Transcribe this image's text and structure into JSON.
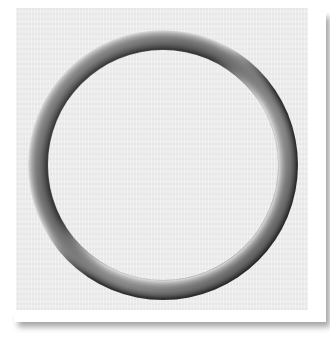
{
  "image": {
    "subject": "shaded ring",
    "description": "3D embossed gray ring on light gray textured panel with white border and drop shadow"
  },
  "colors": {
    "page_background": "#ffffff",
    "panel_background": "#ececec",
    "ring_dark": "#2e2e2e",
    "ring_mid": "#8a8a8a",
    "ring_light": "#d8d8d8",
    "shadow": "#9a9a9a"
  },
  "ring": {
    "center_x": 163,
    "center_y": 161,
    "outer_radius": 135,
    "inner_radius": 115
  }
}
